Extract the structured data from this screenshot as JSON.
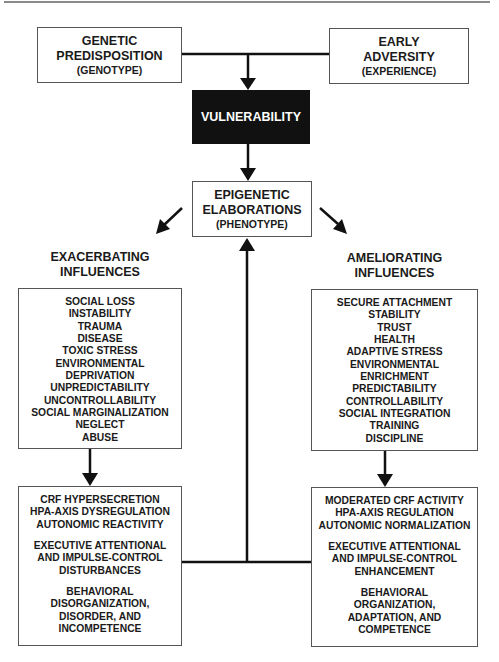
{
  "diagram": {
    "top_left": {
      "line1": "GENETIC",
      "line2": "PREDISPOSITION",
      "sub": "(GENOTYPE)"
    },
    "top_right": {
      "line1": "EARLY",
      "line2": "ADVERSITY",
      "sub": "(EXPERIENCE)"
    },
    "center_dark": {
      "label": "VULNERABILITY"
    },
    "center_box": {
      "line1": "EPIGENETIC",
      "line2": "ELABORATIONS",
      "sub": "(PHENOTYPE)"
    },
    "left_heading": {
      "line1": "EXACERBATING",
      "line2": "INFLUENCES"
    },
    "right_heading": {
      "line1": "AMELIORATING",
      "line2": "INFLUENCES"
    },
    "left_influences": [
      "SOCIAL LOSS",
      "INSTABILITY",
      "TRAUMA",
      "DISEASE",
      "TOXIC STRESS",
      "ENVIRONMENTAL",
      "DEPRIVATION",
      "UNPREDICTABILITY",
      "UNCONTROLLABILITY",
      "SOCIAL MARGINALIZATION",
      "NEGLECT",
      "ABUSE"
    ],
    "right_influences": [
      "SECURE ATTACHMENT",
      "STABILITY",
      "TRUST",
      "HEALTH",
      "ADAPTIVE STRESS",
      "ENVIRONMENTAL",
      "ENRICHMENT",
      "PREDICTABILITY",
      "CONTROLLABILITY",
      "SOCIAL INTEGRATION",
      "TRAINING",
      "DISCIPLINE"
    ],
    "left_outcomes": {
      "group1": [
        "CRF HYPERSECRETION",
        "HPA-AXIS DYSREGULATION",
        "AUTONOMIC REACTIVITY"
      ],
      "group2": [
        "EXECUTIVE ATTENTIONAL",
        "AND IMPULSE-CONTROL",
        "DISTURBANCES"
      ],
      "group3": [
        "BEHAVIORAL",
        "DISORGANIZATION,",
        "DISORDER, AND",
        "INCOMPETENCE"
      ]
    },
    "right_outcomes": {
      "group1": [
        "MODERATED CRF ACTIVITY",
        "HPA-AXIS REGULATION",
        "AUTONOMIC NORMALIZATION"
      ],
      "group2": [
        "EXECUTIVE ATTENTIONAL",
        "AND IMPULSE-CONTROL",
        "ENHANCEMENT"
      ],
      "group3": [
        "BEHAVIORAL",
        "ORGANIZATION,",
        "ADAPTATION, AND",
        "COMPETENCE"
      ]
    },
    "colors": {
      "line": "#111111",
      "box_border": "#555555",
      "dark_fill": "#111111",
      "dark_text": "#ffffff"
    }
  }
}
